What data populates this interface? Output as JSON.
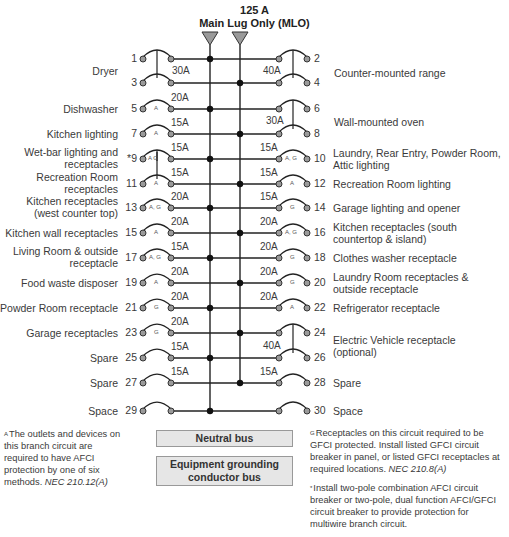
{
  "header": {
    "rating": "125 A",
    "type": "Main Lug Only (MLO)"
  },
  "colors": {
    "line": "#222222",
    "terminal_fill": "#9a9a9a",
    "bus_fill": "#e6e6e6",
    "triangle_fill": "#9a9a9a"
  },
  "left_circuits": [
    {
      "num": "1",
      "label": "Dryer",
      "amp": "30A",
      "tag": ""
    },
    {
      "num": "3",
      "label": "",
      "amp": "",
      "tag": ""
    },
    {
      "num": "5",
      "label": "Dishwasher",
      "amp": "20A",
      "tag": "A"
    },
    {
      "num": "7",
      "label": "Kitchen lighting",
      "amp": "15A",
      "tag": "A"
    },
    {
      "num": "*9",
      "label": "Wet-bar lighting and receptacles",
      "amp": "15A",
      "tag": "A|G"
    },
    {
      "num": "11",
      "label": "Recreation Room receptacles",
      "amp": "15A",
      "tag": "A"
    },
    {
      "num": "13",
      "label": "Kitchen receptacles (west counter top)",
      "amp": "20A",
      "tag": "A, G"
    },
    {
      "num": "15",
      "label": "Kitchen wall receptacles",
      "amp": "20A",
      "tag": "A"
    },
    {
      "num": "17",
      "label": "Living Room & outside receptacle",
      "amp": "15A",
      "tag": "A, G"
    },
    {
      "num": "19",
      "label": "Food waste disposer",
      "amp": "20A",
      "tag": "A"
    },
    {
      "num": "21",
      "label": "Powder Room receptacle",
      "amp": "20A",
      "tag": "G"
    },
    {
      "num": "23",
      "label": "Garage receptacles",
      "amp": "20A",
      "tag": "G"
    },
    {
      "num": "25",
      "label": "Spare",
      "amp": "15A",
      "tag": ""
    },
    {
      "num": "27",
      "label": "Spare",
      "amp": "15A",
      "tag": ""
    },
    {
      "num": "29",
      "label": "Space",
      "amp": "",
      "tag": ""
    }
  ],
  "right_circuits": [
    {
      "num": "2",
      "label": "Counter-mounted range",
      "amp": "40A",
      "tag": ""
    },
    {
      "num": "4",
      "label": "",
      "amp": "",
      "tag": ""
    },
    {
      "num": "6",
      "label": "Wall-mounted oven",
      "amp": "30A",
      "tag": ""
    },
    {
      "num": "8",
      "label": "",
      "amp": "",
      "tag": ""
    },
    {
      "num": "10",
      "label": "Laundry, Rear Entry, Powder Room, Attic lighting",
      "amp": "15A",
      "tag": "A, G"
    },
    {
      "num": "12",
      "label": "Recreation Room lighting",
      "amp": "15A",
      "tag": "A"
    },
    {
      "num": "14",
      "label": "Garage lighting and opener",
      "amp": "15A",
      "tag": "G"
    },
    {
      "num": "16",
      "label": "Kitchen receptacles (south countertop & island)",
      "amp": "20A",
      "tag": "A, G"
    },
    {
      "num": "18",
      "label": "Clothes washer receptacle",
      "amp": "20A",
      "tag": "G"
    },
    {
      "num": "20",
      "label": "Laundry Room receptacles & outside receptacle",
      "amp": "20A",
      "tag": "G"
    },
    {
      "num": "22",
      "label": "Refrigerator receptacle",
      "amp": "20A",
      "tag": "A"
    },
    {
      "num": "24",
      "label": "Electric Vehicle receptacle (optional)",
      "amp": "40A",
      "tag": ""
    },
    {
      "num": "26",
      "label": "",
      "amp": "",
      "tag": ""
    },
    {
      "num": "28",
      "label": "Spare",
      "amp": "15A",
      "tag": ""
    },
    {
      "num": "30",
      "label": "Space",
      "amp": "",
      "tag": ""
    }
  ],
  "labels": {
    "dryer": "Dryer",
    "range": "Counter-mounted range",
    "oven": "Wall-mounted oven",
    "ev_1": "Electric Vehicle receptacle",
    "ev_2": "(optional)"
  },
  "buses": {
    "neutral": "Neutral bus",
    "ground_1": "Equipment grounding",
    "ground_2": "conductor bus"
  },
  "notes": {
    "afci_mark": "A",
    "afci_text": "The outlets and devices on this branch circuit are required to have AFCI protection by one of six methods.",
    "afci_ref": "NEC 210.12(A)",
    "gfci_mark": "G",
    "gfci_text": "Receptacles on this circuit required to be GFCI protected. Install listed GFCI circuit breaker in panel, or listed GFCI receptacles at required locations.",
    "gfci_ref": "NEC 210.8(A)",
    "star_mark": "*",
    "star_text": "Install two-pole combination AFCI circuit breaker or two-pole, dual function AFCI/GFCI circuit breaker to provide protection for multiwire branch circuit."
  }
}
